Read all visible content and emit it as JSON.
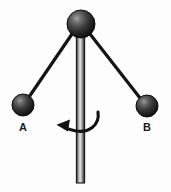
{
  "figure": {
    "canvas": {
      "width": 171,
      "height": 192,
      "background_color": "#fdfdfd"
    },
    "colors": {
      "sphere_dark": "#1c1c1c",
      "sphere_mid": "#4a4a4a",
      "sphere_highlight": "#9a9a9a",
      "sphere_outline": "#0d0d0d",
      "arm_color": "#141414",
      "rod_dark": "#2a2a2a",
      "rod_light": "#d8d8d8",
      "rod_outline": "#1a1a1a",
      "arrow_color": "#111111",
      "label_color": "#1a1a1a"
    },
    "pivot_sphere": {
      "name": "pivot",
      "cx": 81,
      "cy": 24,
      "r": 14,
      "label": ""
    },
    "rod": {
      "name": "vertical-rod",
      "x": 76,
      "y_top": 22,
      "y_bottom": 183,
      "width": 9
    },
    "spheres": [
      {
        "id": "A",
        "label": "A",
        "cx": 23,
        "cy": 105,
        "r": 11,
        "label_x": 23,
        "label_y": 128
      },
      {
        "id": "B",
        "label": "B",
        "cx": 147,
        "cy": 106,
        "r": 11,
        "label_x": 147,
        "label_y": 128
      }
    ],
    "arms": [
      {
        "id": "arm-a",
        "from": "pivot",
        "to": "A",
        "x1": 72,
        "y1": 34,
        "x2": 29,
        "y2": 97
      },
      {
        "id": "arm-b",
        "from": "pivot",
        "to": "B",
        "x1": 90,
        "y1": 34,
        "x2": 140,
        "y2": 98
      }
    ],
    "rotation_arrow": {
      "name": "rotation-arrow",
      "direction": "counterclockwise",
      "arrowhead_points_to": "left",
      "path": "M 98 112 C 100 126, 88 133, 76 131 C 72 130, 68 129, 64 127",
      "head_tip_x": 57,
      "head_tip_y": 125,
      "head_points": "57,125 70,120 68,131"
    }
  }
}
